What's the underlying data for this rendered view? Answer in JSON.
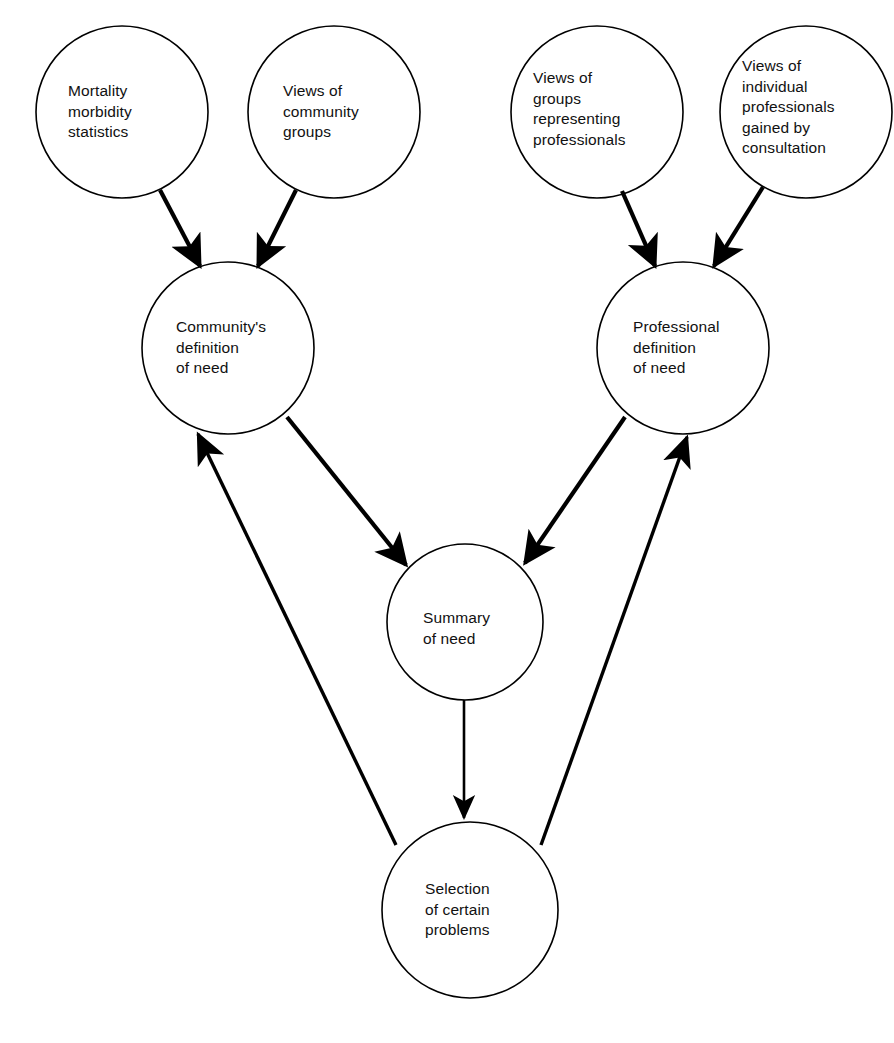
{
  "diagram": {
    "type": "flow-diagram",
    "background_color": "#ffffff",
    "stroke_color": "#000000",
    "text_color": "#111111",
    "nodes": [
      {
        "id": "mortality-morbidity-statistics",
        "label": "Mortality\nmorbidity\nstatistics",
        "cx": 122,
        "cy": 112,
        "r": 86,
        "label_x": 68,
        "label_y": 81
      },
      {
        "id": "views-of-community-groups",
        "label": "Views of\ncommunity\ngroups",
        "cx": 334,
        "cy": 112,
        "r": 86,
        "label_x": 283,
        "label_y": 81
      },
      {
        "id": "views-of-groups-representing-professionals",
        "label": "Views of\ngroups\nrepresenting\nprofessionals",
        "cx": 597,
        "cy": 112,
        "r": 86,
        "label_x": 533,
        "label_y": 68
      },
      {
        "id": "views-of-individual-professionals",
        "label": "Views of\nindividual\nprofessionals\ngained by\nconsultation",
        "cx": 806,
        "cy": 112,
        "r": 86,
        "label_x": 742,
        "label_y": 56
      },
      {
        "id": "communitys-definition-of-need",
        "label": "Community's\ndefinition\nof need",
        "cx": 228,
        "cy": 348,
        "r": 86,
        "label_x": 176,
        "label_y": 317
      },
      {
        "id": "professional-definition-of-need",
        "label": "Professional\ndefinition\nof need",
        "cx": 683,
        "cy": 348,
        "r": 86,
        "label_x": 633,
        "label_y": 317
      },
      {
        "id": "summary-of-need",
        "label": "Summary\nof need",
        "cx": 465,
        "cy": 622,
        "r": 78,
        "label_x": 423,
        "label_y": 608
      },
      {
        "id": "selection-of-certain-problems",
        "label": "Selection\nof certain\nproblems",
        "cx": 470,
        "cy": 910,
        "r": 88,
        "label_x": 425,
        "label_y": 879
      }
    ],
    "edges": [
      {
        "id": "stats-to-community",
        "from": "mortality-morbidity-statistics",
        "to": "communitys-definition-of-need",
        "arrow": "end"
      },
      {
        "id": "community-groups-to-community",
        "from": "views-of-community-groups",
        "to": "communitys-definition-of-need",
        "arrow": "end"
      },
      {
        "id": "prof-groups-to-professional",
        "from": "views-of-groups-representing-professionals",
        "to": "professional-definition-of-need",
        "arrow": "end"
      },
      {
        "id": "individual-prof-to-professional",
        "from": "views-of-individual-professionals",
        "to": "professional-definition-of-need",
        "arrow": "end"
      },
      {
        "id": "community-to-summary",
        "from": "communitys-definition-of-need",
        "to": "summary-of-need",
        "arrow": "end"
      },
      {
        "id": "professional-to-summary",
        "from": "professional-definition-of-need",
        "to": "summary-of-need",
        "arrow": "end"
      },
      {
        "id": "summary-to-selection",
        "from": "summary-of-need",
        "to": "selection-of-certain-problems",
        "arrow": "end"
      },
      {
        "id": "selection-to-community",
        "from": "selection-of-certain-problems",
        "to": "communitys-definition-of-need",
        "arrow": "end"
      },
      {
        "id": "selection-to-professional",
        "from": "selection-of-certain-problems",
        "to": "professional-definition-of-need",
        "arrow": "end"
      }
    ]
  },
  "artifacts": {
    "top_cropped_text": ""
  }
}
